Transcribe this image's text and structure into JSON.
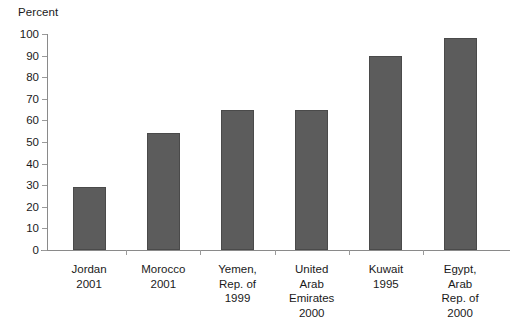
{
  "chart_data": {
    "type": "bar",
    "title": "",
    "subtitle": "",
    "xlabel": "",
    "ylabel": "Percent",
    "ylim": [
      0,
      100
    ],
    "ytick_step": 10,
    "yticks": [
      0,
      10,
      20,
      30,
      40,
      50,
      60,
      70,
      80,
      90,
      100
    ],
    "grid": false,
    "legend": null,
    "bar_color": "#5c5c5c",
    "axis_color": "#8a8a8a",
    "categories": [
      "Jordan 2001",
      "Morocco 2001",
      "Yemen, Rep. of 1999",
      "United Arab Emirates 2000",
      "Kuwait 1995",
      "Egypt, Arab Rep. of 2000"
    ],
    "category_lines": [
      [
        "Jordan",
        "2001"
      ],
      [
        "Morocco",
        "2001"
      ],
      [
        "Yemen,",
        "Rep. of",
        "1999"
      ],
      [
        "United",
        "Arab",
        "Emirates",
        "2000"
      ],
      [
        "Kuwait",
        "1995"
      ],
      [
        "Egypt,",
        "Arab",
        "Rep. of",
        "2000"
      ]
    ],
    "values": [
      29,
      54,
      65,
      65,
      90,
      98
    ]
  }
}
